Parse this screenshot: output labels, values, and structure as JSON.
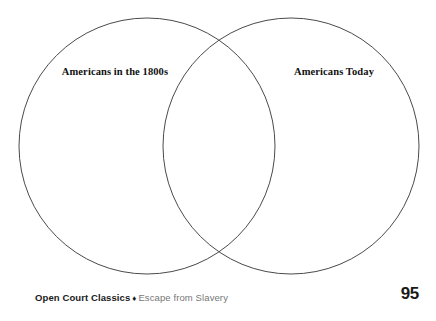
{
  "document": {
    "type": "venn-diagram-worksheet",
    "background_color": "#ffffff"
  },
  "diagram": {
    "kind": "venn",
    "stroke_color": "#4a4a4a",
    "fill": "none",
    "circles": [
      {
        "id": "left",
        "label": "Americans in the 1800s",
        "center_x": 147,
        "center_y": 146,
        "radius": 128
      },
      {
        "id": "right",
        "label": "Americans Today",
        "center_x": 291,
        "center_y": 146,
        "radius": 128
      }
    ],
    "left_label": "Americans in the 1800s",
    "right_label": "Americans Today",
    "overlap_label": ""
  },
  "footer": {
    "series": "Open Court Classics",
    "separator": "♦",
    "title": "Escape from Slavery",
    "page_number": "95",
    "series_color": "#1a1a1a",
    "title_color": "#777777"
  }
}
